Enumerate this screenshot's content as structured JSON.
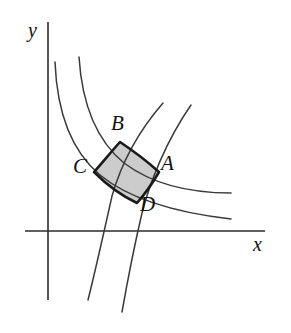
{
  "figure": {
    "background_color": "#ffffff",
    "curve_color": "#3a3a3a",
    "axis_color": "#2b2b2b",
    "outline_color": "#1a1a1a",
    "shaded_region_color": "#cccccc"
  },
  "axes": {
    "x_label": "x",
    "y_label": "y",
    "origin": {
      "x": 48,
      "y": 231
    },
    "x_axis": {
      "x1": 25,
      "y1": 231,
      "x2": 265,
      "y2": 231
    },
    "y_axis": {
      "x1": 48,
      "y1": 22,
      "x2": 48,
      "y2": 300
    }
  },
  "points": [
    {
      "id": "A",
      "label": "A",
      "x": 159,
      "y": 172,
      "label_x": 161,
      "label_y": 153
    },
    {
      "id": "B",
      "label": "B",
      "x": 120,
      "y": 142,
      "label_x": 111,
      "label_y": 113
    },
    {
      "id": "C",
      "label": "C",
      "x": 94,
      "y": 172,
      "label_x": 73,
      "label_y": 156
    },
    {
      "id": "D",
      "label": "D",
      "x": 137,
      "y": 203,
      "label_x": 140,
      "label_y": 194
    }
  ],
  "curves": {
    "family_decreasing": [
      {
        "name": "inner-hyperbola",
        "path": "M 55 62 C 57 112, 70 150, 100 175 C 128 198, 170 212, 231 219"
      },
      {
        "name": "outer-hyperbola",
        "path": "M 79 57 C 82 104, 96 140, 124 163 C 152 184, 189 193, 231 193"
      }
    ],
    "family_increasing": [
      {
        "name": "inner-orthogonal-curve",
        "path": "M 88 300 C 96 268, 104 232, 112 196 C 120 168, 136 134, 163 103"
      },
      {
        "name": "outer-orthogonal-curve",
        "path": "M 122 312 C 128 278, 135 243, 142 213 C 150 182, 166 141, 191 105"
      }
    ]
  },
  "shaded_region": {
    "name": "region-ABCD",
    "vertex_order": [
      "B",
      "A",
      "D",
      "C"
    ],
    "path": "M 120 142 C 135 152, 149 163, 159 172 C 152 184, 145 194, 137 203 C 122 196, 107 185, 94 172 C 102 163, 111 152, 120 142 Z"
  }
}
